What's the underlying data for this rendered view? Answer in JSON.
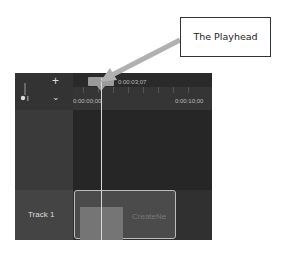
{
  "callout": {
    "label": "The Playhead"
  },
  "timeline": {
    "playhead_time": "0:00:03;07",
    "ruler_start": "0:00:00;00",
    "ruler_mark": "0:00:10;00",
    "add_track_icon": "plus-icon",
    "collapse_icon": "chevron-down-icon"
  },
  "tracks": [
    {
      "label": "Track 1",
      "clip": {
        "name": "CreateNe"
      }
    }
  ],
  "colors": {
    "panel_bg": "#2e2e2e",
    "playhead": "#d8d8d8",
    "callout_arrow": "#9a9a9a"
  }
}
